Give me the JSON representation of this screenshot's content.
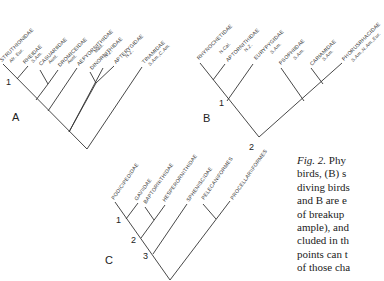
{
  "figure": {
    "panels": {
      "A": {
        "label": "A",
        "taxa": [
          {
            "name": "STRUTHIONIDAE",
            "region": "Afr. Eur."
          },
          {
            "name": "RHEIDAE",
            "region": "S.Am."
          },
          {
            "name": "CASUARIIDAE",
            "region": "Aust."
          },
          {
            "name": "DROMICEIDAE",
            "region": "Aust."
          },
          {
            "name": "AEPYORNITHIDAE",
            "region": "Mad."
          },
          {
            "name": "DINORNITHIDAE",
            "region": "N.Z."
          },
          {
            "name": "APTERYGIDAE",
            "region": "N.Z."
          },
          {
            "name": "TINAMIDAE",
            "region": "S.Am.,C.Am."
          }
        ],
        "nodes": [
          "1"
        ]
      },
      "B": {
        "label": "B",
        "taxa": [
          {
            "name": "RHYNOCHETIDAE",
            "region": "N.Cal."
          },
          {
            "name": "APTORNITHIDAE",
            "region": "N.Z."
          },
          {
            "name": "EURYPYGIDAE",
            "region": "S.Am."
          },
          {
            "name": "PSOPHIIDAE",
            "region": "S.Am."
          },
          {
            "name": "CARIAMIDAE",
            "region": "S.Am."
          },
          {
            "name": "PHORUSRHACIDAE",
            "region": "S.Am.,N.Am.,Eur."
          }
        ],
        "nodes": [
          "1",
          "2"
        ]
      },
      "C": {
        "label": "C",
        "taxa": [
          {
            "name": "PODICIPEDIDAE"
          },
          {
            "name": "GAVIIDAE"
          },
          {
            "name": "BAPTORNITHIDAE"
          },
          {
            "name": "HESPERORNITHIDAE"
          },
          {
            "name": "SPHENISCIDAE"
          },
          {
            "name": "PELECANIFORMES"
          },
          {
            "name": "PROCELLARIIFORMES"
          }
        ],
        "nodes": [
          "1",
          "2",
          "3"
        ]
      }
    },
    "caption": {
      "lines": [
        {
          "italic": "Fig. 2.",
          "text": " Phy"
        },
        {
          "text": "birds, (B) s"
        },
        {
          "text": "diving birds"
        },
        {
          "text": "and B are e"
        },
        {
          "text": "of breakup"
        },
        {
          "text": "ample), and"
        },
        {
          "text": "cluded in th"
        },
        {
          "text": "points can t"
        },
        {
          "text": "of those cha"
        }
      ]
    }
  }
}
